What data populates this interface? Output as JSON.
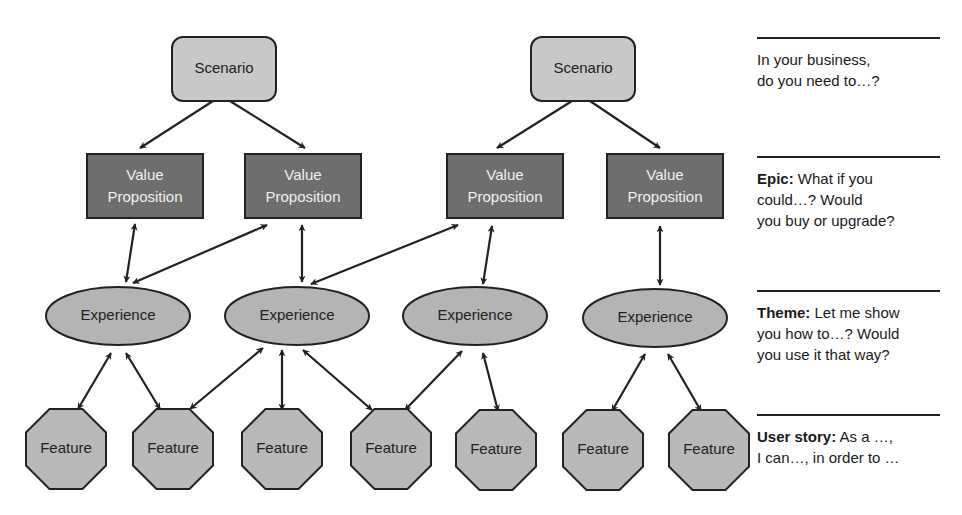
{
  "colors": {
    "scenario_fill": "#c8c8c8",
    "value_prop_fill": "#6e6e6e",
    "experience_fill": "#b4b4b4",
    "feature_fill": "#b9b9b9",
    "stroke": "#222222"
  },
  "nodes": {
    "scenarios": [
      {
        "id": "s1",
        "label": "Scenario",
        "cx": 224,
        "cy": 69
      },
      {
        "id": "s2",
        "label": "Scenario",
        "cx": 583,
        "cy": 69
      }
    ],
    "value_propositions": [
      {
        "id": "v1",
        "line1": "Value",
        "line2": "Proposition",
        "cx": 145,
        "cy": 186
      },
      {
        "id": "v2",
        "line1": "Value",
        "line2": "Proposition",
        "cx": 303,
        "cy": 186
      },
      {
        "id": "v3",
        "line1": "Value",
        "line2": "Proposition",
        "cx": 505,
        "cy": 186
      },
      {
        "id": "v4",
        "line1": "Value",
        "line2": "Proposition",
        "cx": 665,
        "cy": 186
      }
    ],
    "experiences": [
      {
        "id": "e1",
        "label": "Experience",
        "cx": 118,
        "cy": 316
      },
      {
        "id": "e2",
        "label": "Experience",
        "cx": 297,
        "cy": 316
      },
      {
        "id": "e3",
        "label": "Experience",
        "cx": 475,
        "cy": 316
      },
      {
        "id": "e4",
        "label": "Experience",
        "cx": 655,
        "cy": 318
      }
    ],
    "features": [
      {
        "id": "f1",
        "label": "Feature",
        "cx": 66,
        "cy": 449
      },
      {
        "id": "f2",
        "label": "Feature",
        "cx": 173,
        "cy": 449
      },
      {
        "id": "f3",
        "label": "Feature",
        "cx": 282,
        "cy": 449
      },
      {
        "id": "f4",
        "label": "Feature",
        "cx": 391,
        "cy": 449
      },
      {
        "id": "f5",
        "label": "Feature",
        "cx": 496,
        "cy": 450
      },
      {
        "id": "f6",
        "label": "Feature",
        "cx": 603,
        "cy": 450
      },
      {
        "id": "f7",
        "label": "Feature",
        "cx": 709,
        "cy": 450
      }
    ]
  },
  "edges": [
    {
      "from": "s1",
      "to": "v1",
      "type": "one-way",
      "x1": 213,
      "y1": 101,
      "x2": 140,
      "y2": 148
    },
    {
      "from": "s1",
      "to": "v2",
      "type": "one-way",
      "x1": 230,
      "y1": 101,
      "x2": 305,
      "y2": 148
    },
    {
      "from": "s2",
      "to": "v3",
      "type": "one-way",
      "x1": 572,
      "y1": 101,
      "x2": 497,
      "y2": 148
    },
    {
      "from": "s2",
      "to": "v4",
      "type": "one-way",
      "x1": 590,
      "y1": 101,
      "x2": 660,
      "y2": 148
    },
    {
      "from": "v1",
      "to": "e1",
      "type": "two-way",
      "x1": 135,
      "y1": 224,
      "x2": 126,
      "y2": 282
    },
    {
      "from": "v2",
      "to": "e1",
      "type": "two-way",
      "x1": 267,
      "y1": 225,
      "x2": 133,
      "y2": 283
    },
    {
      "from": "v2",
      "to": "e2",
      "type": "two-way",
      "x1": 302,
      "y1": 225,
      "x2": 302,
      "y2": 282
    },
    {
      "from": "v3",
      "to": "e2",
      "type": "two-way",
      "x1": 458,
      "y1": 225,
      "x2": 311,
      "y2": 284
    },
    {
      "from": "v3",
      "to": "e3",
      "type": "two-way",
      "x1": 492,
      "y1": 226,
      "x2": 483,
      "y2": 284
    },
    {
      "from": "v4",
      "to": "e4",
      "type": "two-way",
      "x1": 660,
      "y1": 226,
      "x2": 660,
      "y2": 285
    },
    {
      "from": "e1",
      "to": "f1",
      "type": "two-way",
      "x1": 111,
      "y1": 353,
      "x2": 78,
      "y2": 409
    },
    {
      "from": "e1",
      "to": "f2",
      "type": "two-way",
      "x1": 126,
      "y1": 353,
      "x2": 160,
      "y2": 409
    },
    {
      "from": "e2",
      "to": "f2",
      "type": "two-way",
      "x1": 263,
      "y1": 348,
      "x2": 190,
      "y2": 409
    },
    {
      "from": "e2",
      "to": "f3",
      "type": "two-way",
      "x1": 282,
      "y1": 350,
      "x2": 282,
      "y2": 410
    },
    {
      "from": "e2",
      "to": "f4",
      "type": "two-way",
      "x1": 303,
      "y1": 350,
      "x2": 372,
      "y2": 410
    },
    {
      "from": "e3",
      "to": "f4",
      "type": "two-way",
      "x1": 462,
      "y1": 351,
      "x2": 405,
      "y2": 410
    },
    {
      "from": "e3",
      "to": "f5",
      "type": "two-way",
      "x1": 483,
      "y1": 353,
      "x2": 498,
      "y2": 411
    },
    {
      "from": "e4",
      "to": "f6",
      "type": "two-way",
      "x1": 645,
      "y1": 354,
      "x2": 612,
      "y2": 411
    },
    {
      "from": "e4",
      "to": "f7",
      "type": "two-way",
      "x1": 668,
      "y1": 354,
      "x2": 701,
      "y2": 411
    }
  ],
  "legend": [
    {
      "top": 37,
      "bold": "",
      "text": "In your business, do you need to…?",
      "lines": [
        "In your business,",
        "do you need to…?"
      ]
    },
    {
      "top": 156,
      "bold": "Epic:",
      "text": "What if you could…? Would you buy or upgrade?",
      "lines": [
        "What if you",
        "could…? Would",
        "you buy or upgrade?"
      ]
    },
    {
      "top": 290,
      "bold": "Theme:",
      "text": "Let me show you how to…? Would you use it that way?",
      "lines": [
        "Let me show",
        "you how to…? Would",
        "you use it that way?"
      ]
    },
    {
      "top": 414,
      "bold": "User story:",
      "text": "As a …, I can…, in order to …",
      "lines": [
        "As a …,",
        "I can…, in order to …"
      ]
    }
  ]
}
